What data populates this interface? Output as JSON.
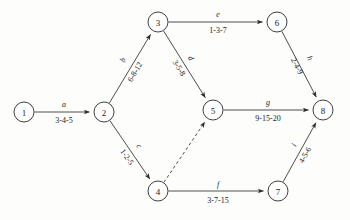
{
  "diagram": {
    "type": "activity-on-arrow-network",
    "canvas": {
      "width": 350,
      "height": 220,
      "background": "#fdfdfc"
    },
    "node_radius": 10,
    "nodes": [
      {
        "id": "1",
        "label": "1",
        "cx": 24,
        "cy": 112
      },
      {
        "id": "2",
        "label": "2",
        "cx": 104,
        "cy": 112
      },
      {
        "id": "3",
        "label": "3",
        "cx": 158,
        "cy": 22
      },
      {
        "id": "4",
        "label": "4",
        "cx": 158,
        "cy": 191
      },
      {
        "id": "5",
        "label": "5",
        "cx": 213,
        "cy": 110
      },
      {
        "id": "6",
        "label": "6",
        "cx": 277,
        "cy": 22
      },
      {
        "id": "7",
        "label": "7",
        "cx": 278,
        "cy": 191
      },
      {
        "id": "8",
        "label": "8",
        "cx": 323,
        "cy": 110
      }
    ],
    "edges": [
      {
        "id": "a",
        "name": "a",
        "duration": "3-4-5",
        "from": "1",
        "to": "2",
        "style": "solid",
        "arrow": true,
        "name_x": 64,
        "name_y": 104,
        "name_rotate": 0,
        "time_x": 64,
        "time_y": 120,
        "time_rotate": 0
      },
      {
        "id": "b",
        "name": "b",
        "duration": "6-8-12",
        "from": "2",
        "to": "3",
        "style": "solid",
        "arrow": true,
        "name_x": 123,
        "name_y": 60,
        "name_rotate": -59,
        "time_x": 135,
        "time_y": 72,
        "time_rotate": -59
      },
      {
        "id": "c",
        "name": "c",
        "duration": "1-2-5",
        "from": "2",
        "to": "4",
        "style": "solid",
        "arrow": true,
        "name_x": 139,
        "name_y": 146,
        "name_rotate": 55,
        "time_x": 127,
        "time_y": 157,
        "time_rotate": 55
      },
      {
        "id": "d",
        "name": "d",
        "duration": "3-5-8",
        "from": "3",
        "to": "5",
        "style": "solid",
        "arrow": true,
        "name_x": 191,
        "name_y": 58,
        "name_rotate": 58,
        "time_x": 179,
        "time_y": 68,
        "time_rotate": 58
      },
      {
        "id": "e",
        "name": "e",
        "duration": "1-3-7",
        "from": "3",
        "to": "6",
        "style": "solid",
        "arrow": true,
        "name_x": 218,
        "name_y": 14,
        "name_rotate": 0,
        "time_x": 218,
        "time_y": 30,
        "time_rotate": 0
      },
      {
        "id": "f",
        "name": "f",
        "duration": "3-7-15",
        "from": "4",
        "to": "7",
        "style": "solid",
        "arrow": true,
        "name_x": 218,
        "name_y": 184,
        "name_rotate": 0,
        "time_x": 218,
        "time_y": 200,
        "time_rotate": 0
      },
      {
        "id": "g",
        "name": "g",
        "duration": "9-15-20",
        "from": "5",
        "to": "8",
        "style": "solid",
        "arrow": true,
        "name_x": 268,
        "name_y": 102,
        "name_rotate": 0,
        "time_x": 268,
        "time_y": 118,
        "time_rotate": 0
      },
      {
        "id": "h",
        "name": "h",
        "duration": "2-4-9",
        "from": "6",
        "to": "8",
        "style": "solid",
        "arrow": true,
        "name_x": 310,
        "name_y": 58,
        "name_rotate": 62,
        "time_x": 297,
        "time_y": 66,
        "time_rotate": 62
      },
      {
        "id": "i",
        "name": "i",
        "duration": "4-5-6",
        "from": "7",
        "to": "8",
        "style": "solid",
        "arrow": true,
        "name_x": 294,
        "name_y": 145,
        "name_rotate": -61,
        "time_x": 305,
        "time_y": 155,
        "time_rotate": -61
      },
      {
        "id": "dummy",
        "name": "",
        "duration": "",
        "from": "4",
        "to": "5",
        "style": "dashed",
        "arrow": true,
        "name_x": 0,
        "name_y": 0,
        "name_rotate": 0,
        "time_x": 0,
        "time_y": 0,
        "time_rotate": 0
      }
    ],
    "colors": {
      "stroke": "#3a3a3a",
      "node_stroke": "#2b2b2b",
      "text": "#1a1a1a",
      "background": "#fdfdfc"
    }
  }
}
